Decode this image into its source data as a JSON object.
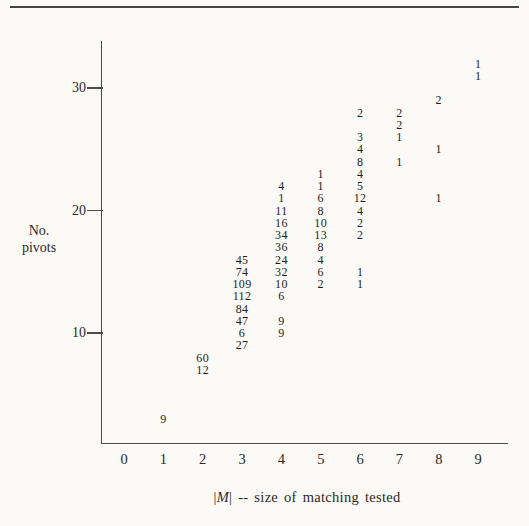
{
  "page": {
    "background_color": "#fbfaf6",
    "text_color": "#2a2927",
    "axis_color": "#4d4b49"
  },
  "chart_data": {
    "type": "scatter",
    "marker_style": "numeric-count-labels",
    "title": "",
    "xlabel": "|M| -- size of matching tested",
    "xlabel_parts": {
      "bar1": "|",
      "m": "M",
      "bar2": "|",
      "rest": " -- size of matching tested"
    },
    "ylabel": "No. pivots",
    "ylabel_line1": "No.",
    "ylabel_line2": "pivots",
    "x_tick_labels": [
      "0",
      "1",
      "2",
      "3",
      "4",
      "5",
      "6",
      "7",
      "8",
      "9"
    ],
    "y_tick_labels": [
      "10",
      "20",
      "30"
    ],
    "y_ticks": [
      10,
      20,
      30
    ],
    "xlim": [
      -0.6,
      9.8
    ],
    "ylim": [
      1,
      34
    ],
    "grid": false,
    "legend": false,
    "points": [
      {
        "x": 1,
        "pivots": 3,
        "label": "9"
      },
      {
        "x": 2,
        "pivots": 8,
        "label": "60"
      },
      {
        "x": 2,
        "pivots": 7,
        "label": "12"
      },
      {
        "x": 3,
        "pivots": 16,
        "label": "45"
      },
      {
        "x": 3,
        "pivots": 15,
        "label": "74"
      },
      {
        "x": 3,
        "pivots": 14,
        "label": "109"
      },
      {
        "x": 3,
        "pivots": 13,
        "label": "112"
      },
      {
        "x": 3,
        "pivots": 12,
        "label": "84"
      },
      {
        "x": 3,
        "pivots": 11,
        "label": "47"
      },
      {
        "x": 3,
        "pivots": 10,
        "label": "6"
      },
      {
        "x": 3,
        "pivots": 9,
        "label": "27"
      },
      {
        "x": 4,
        "pivots": 22,
        "label": "4"
      },
      {
        "x": 4,
        "pivots": 21,
        "label": "1"
      },
      {
        "x": 4,
        "pivots": 20,
        "label": "11"
      },
      {
        "x": 4,
        "pivots": 19,
        "label": "16"
      },
      {
        "x": 4,
        "pivots": 18,
        "label": "34"
      },
      {
        "x": 4,
        "pivots": 17,
        "label": "36"
      },
      {
        "x": 4,
        "pivots": 16,
        "label": "24"
      },
      {
        "x": 4,
        "pivots": 15,
        "label": "32"
      },
      {
        "x": 4,
        "pivots": 14,
        "label": "10"
      },
      {
        "x": 4,
        "pivots": 13,
        "label": "6"
      },
      {
        "x": 4,
        "pivots": 11,
        "label": "9"
      },
      {
        "x": 4,
        "pivots": 10,
        "label": "9"
      },
      {
        "x": 5,
        "pivots": 23,
        "label": "1"
      },
      {
        "x": 5,
        "pivots": 22,
        "label": "1"
      },
      {
        "x": 5,
        "pivots": 21,
        "label": "6"
      },
      {
        "x": 5,
        "pivots": 20,
        "label": "8"
      },
      {
        "x": 5,
        "pivots": 19,
        "label": "10"
      },
      {
        "x": 5,
        "pivots": 18,
        "label": "13"
      },
      {
        "x": 5,
        "pivots": 17,
        "label": "8"
      },
      {
        "x": 5,
        "pivots": 16,
        "label": "4"
      },
      {
        "x": 5,
        "pivots": 15,
        "label": "6"
      },
      {
        "x": 5,
        "pivots": 14,
        "label": "2"
      },
      {
        "x": 6,
        "pivots": 28,
        "label": "2"
      },
      {
        "x": 6,
        "pivots": 26,
        "label": "3"
      },
      {
        "x": 6,
        "pivots": 25,
        "label": "4"
      },
      {
        "x": 6,
        "pivots": 24,
        "label": "8"
      },
      {
        "x": 6,
        "pivots": 23,
        "label": "4"
      },
      {
        "x": 6,
        "pivots": 22,
        "label": "5"
      },
      {
        "x": 6,
        "pivots": 21,
        "label": "12"
      },
      {
        "x": 6,
        "pivots": 20,
        "label": "4"
      },
      {
        "x": 6,
        "pivots": 19,
        "label": "2"
      },
      {
        "x": 6,
        "pivots": 18,
        "label": "2"
      },
      {
        "x": 6,
        "pivots": 15,
        "label": "1"
      },
      {
        "x": 6,
        "pivots": 14,
        "label": "1"
      },
      {
        "x": 7,
        "pivots": 28,
        "label": "2"
      },
      {
        "x": 7,
        "pivots": 27,
        "label": "2"
      },
      {
        "x": 7,
        "pivots": 26,
        "label": "1"
      },
      {
        "x": 7,
        "pivots": 24,
        "label": "1"
      },
      {
        "x": 8,
        "pivots": 29,
        "label": "2"
      },
      {
        "x": 8,
        "pivots": 25,
        "label": "1"
      },
      {
        "x": 8,
        "pivots": 21,
        "label": "1"
      },
      {
        "x": 9,
        "pivots": 32,
        "label": "1"
      },
      {
        "x": 9,
        "pivots": 31,
        "label": "1"
      }
    ]
  }
}
